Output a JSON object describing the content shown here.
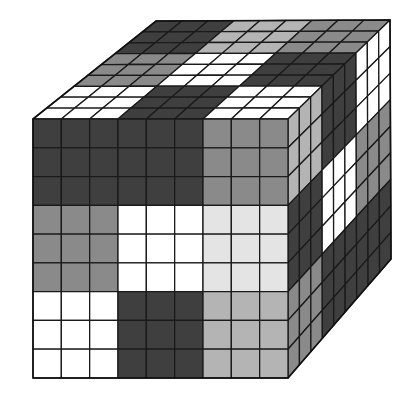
{
  "figure": {
    "grid_size": 9,
    "block_size": 3
  },
  "palette": {
    "D": "#3f3f3f",
    "M": "#8a8a8a",
    "L": "#b4b4b4",
    "P": "#e4e4e4",
    "W": "#ffffff"
  },
  "faces": {
    "front": {
      "quad": [
        [
          33,
          119
        ],
        [
          288,
          119
        ],
        [
          288,
          378
        ],
        [
          33,
          378
        ]
      ],
      "blocks": [
        [
          "D",
          "D",
          "M"
        ],
        [
          "M",
          "W",
          "P"
        ],
        [
          "W",
          "D",
          "L"
        ]
      ]
    },
    "top": {
      "quad": [
        [
          156,
          21
        ],
        [
          390,
          20
        ],
        [
          288,
          119
        ],
        [
          33,
          119
        ]
      ],
      "blocks": [
        [
          "D",
          "L",
          "M"
        ],
        [
          "M",
          "W",
          "D"
        ],
        [
          "W",
          "D",
          "W"
        ]
      ]
    },
    "right": {
      "quad": [
        [
          288,
          119
        ],
        [
          390,
          20
        ],
        [
          391,
          259
        ],
        [
          288,
          378
        ]
      ],
      "blocks": [
        [
          "L",
          "D",
          "W"
        ],
        [
          "D",
          "W",
          "M"
        ],
        [
          "M",
          "D",
          "D"
        ]
      ]
    }
  }
}
